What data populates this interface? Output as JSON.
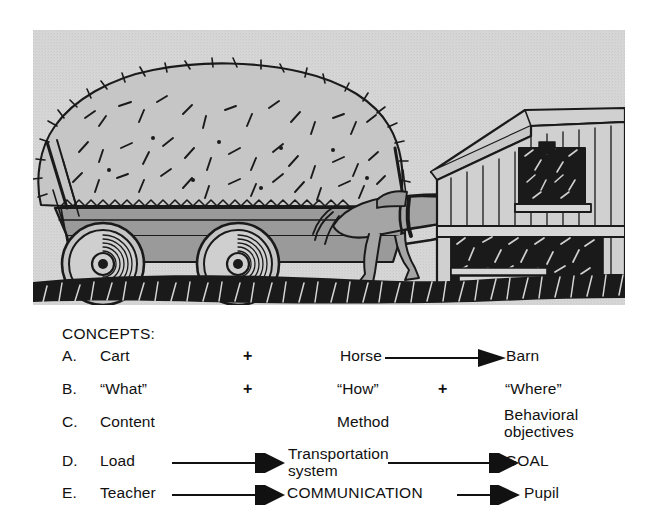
{
  "illustration": {
    "name": "horse-drawn-hay-cart-heading-to-barn",
    "elements": [
      {
        "name": "hay-load-icon",
        "label": "hay load"
      },
      {
        "name": "cart-icon",
        "label": "cart"
      },
      {
        "name": "horse-icon",
        "label": "horse"
      },
      {
        "name": "barn-icon",
        "label": "barn"
      },
      {
        "name": "ground-path-icon",
        "label": "ground path"
      }
    ],
    "background_color": "#d6d6d6",
    "ink_color": "#1a1a1a",
    "fill_gray": "#a0a0a0"
  },
  "concepts": {
    "heading": "CONCEPTS:",
    "rows": [
      {
        "letter": "A.",
        "col1": "Cart",
        "op1": "+",
        "col2": "Horse",
        "op2": "",
        "col3": "Barn",
        "arrow_after_col2": true,
        "arrow_after_col1": false
      },
      {
        "letter": "B.",
        "col1": "“What”",
        "op1": "+",
        "col2": "“How”",
        "op2": "+",
        "col3": "“Where”",
        "arrow_after_col2": false,
        "arrow_after_col1": false
      },
      {
        "letter": "C.",
        "col1": "Content",
        "op1": "",
        "col2": "Method",
        "op2": "",
        "col3": "Behavioral\nobjectives",
        "arrow_after_col2": false,
        "arrow_after_col1": false
      },
      {
        "letter": "D.",
        "col1": "Load",
        "op1": "",
        "col2": "Transportation\nsystem",
        "op2": "",
        "col3": "GOAL",
        "arrow_after_col2": true,
        "arrow_after_col1": true
      },
      {
        "letter": "E.",
        "col1": "Teacher",
        "op1": "",
        "col2": "COMMUNICATION",
        "op2": "",
        "col3": "Pupil",
        "arrow_after_col2": true,
        "arrow_after_col1": true
      }
    ]
  }
}
